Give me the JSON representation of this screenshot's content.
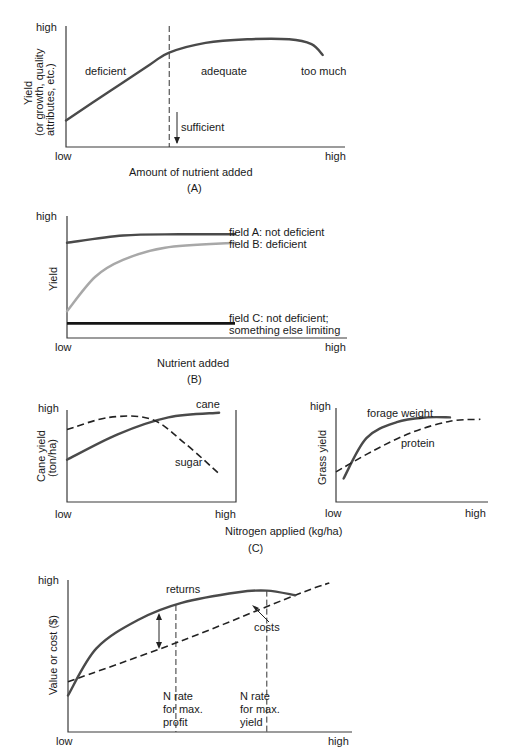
{
  "chart_data": [
    {
      "panel": "A",
      "type": "line",
      "title": "(A)",
      "xlabel": "Amount of nutrient added",
      "ylabel": [
        "Yield",
        "(or growth, quality",
        "attributes, etc.)"
      ],
      "x_ticks": [
        "low",
        "high"
      ],
      "y_ticks": [
        "high"
      ],
      "series": [
        {
          "name": "yield response",
          "style": "solid",
          "x": [
            0,
            0.15,
            0.3,
            0.37,
            0.5,
            0.65,
            0.8,
            0.88,
            0.92
          ],
          "y": [
            0.22,
            0.45,
            0.68,
            0.78,
            0.86,
            0.89,
            0.89,
            0.85,
            0.76
          ]
        }
      ],
      "reference_lines": [
        {
          "orientation": "vertical",
          "x": 0.37,
          "style": "dashed"
        }
      ],
      "annotations": {
        "deficient": "deficient",
        "adequate": "adequate",
        "too_much": "too much",
        "sufficient": "sufficient"
      }
    },
    {
      "panel": "B",
      "type": "line",
      "title": "(B)",
      "xlabel": "Nutrient added",
      "ylabel": "Yield",
      "x_ticks": [
        "low",
        "high"
      ],
      "y_ticks": [
        "high"
      ],
      "series": [
        {
          "name": "field A: not deficient",
          "color": "#4a4a4a",
          "x": [
            0,
            0.2,
            0.4,
            0.6
          ],
          "y": [
            0.78,
            0.84,
            0.85,
            0.85
          ]
        },
        {
          "name": "field B: deficient",
          "color": "#a8a8a8",
          "x": [
            0,
            0.1,
            0.2,
            0.35,
            0.6
          ],
          "y": [
            0.22,
            0.5,
            0.64,
            0.74,
            0.78
          ]
        },
        {
          "name": "field C: not deficient;",
          "name_line2": "something else limiting",
          "color": "#151515",
          "x": [
            0,
            0.6
          ],
          "y": [
            0.12,
            0.12
          ]
        }
      ]
    },
    {
      "panel": "C-left",
      "type": "line",
      "title": "(C)",
      "xlabel": "Nitrogen applied (kg/ha)",
      "ylabel": [
        "Cane yield",
        "(ton/ha)"
      ],
      "x_ticks": [
        "low",
        "high"
      ],
      "y_ticks": [
        "high"
      ],
      "series": [
        {
          "name": "cane",
          "style": "solid",
          "x": [
            0,
            0.3,
            0.6,
            0.9
          ],
          "y": [
            0.45,
            0.72,
            0.9,
            0.95
          ]
        },
        {
          "name": "sugar",
          "style": "dashed",
          "x": [
            0,
            0.25,
            0.5,
            0.7,
            0.9
          ],
          "y": [
            0.77,
            0.9,
            0.88,
            0.62,
            0.3
          ]
        }
      ]
    },
    {
      "panel": "C-right",
      "type": "line",
      "xlabel": "",
      "ylabel": "Grass yield",
      "x_ticks": [
        "low",
        "high"
      ],
      "y_ticks": [
        "high"
      ],
      "series": [
        {
          "name": "forage weight",
          "style": "solid",
          "x": [
            0.05,
            0.2,
            0.4,
            0.6,
            0.75
          ],
          "y": [
            0.25,
            0.68,
            0.85,
            0.9,
            0.9
          ]
        },
        {
          "name": "protein",
          "style": "dashed",
          "x": [
            0,
            0.25,
            0.5,
            0.75,
            0.95
          ],
          "y": [
            0.32,
            0.55,
            0.74,
            0.86,
            0.88
          ]
        }
      ]
    },
    {
      "panel": "D",
      "type": "line",
      "xlabel": "",
      "ylabel": "Value or cost ($)",
      "x_ticks": [
        "low",
        "high"
      ],
      "y_ticks": [
        "high"
      ],
      "series": [
        {
          "name": "returns",
          "style": "solid",
          "x": [
            0,
            0.1,
            0.25,
            0.4,
            0.6,
            0.7,
            0.8
          ],
          "y": [
            0.24,
            0.55,
            0.74,
            0.85,
            0.92,
            0.93,
            0.9
          ]
        },
        {
          "name": "costs",
          "style": "dashed",
          "x": [
            0,
            0.4,
            0.8,
            0.92
          ],
          "y": [
            0.33,
            0.6,
            0.9,
            0.98
          ]
        }
      ],
      "reference_lines": [
        {
          "orientation": "vertical",
          "x": 0.38,
          "label": [
            "N rate",
            "for max.",
            "profit"
          ]
        },
        {
          "orientation": "vertical",
          "x": 0.7,
          "label": [
            "N rate",
            "for max.",
            "yield"
          ]
        }
      ]
    }
  ]
}
